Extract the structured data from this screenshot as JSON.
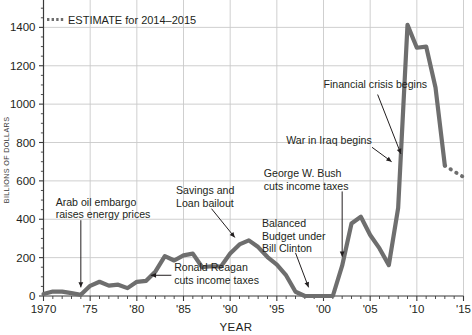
{
  "chart_data": {
    "type": "line",
    "title": "",
    "xlabel": "YEAR",
    "ylabel": "BILLIONS OF DOLLARS",
    "xlim": [
      1970,
      2015
    ],
    "ylim": [
      0,
      1600
    ],
    "grid": true,
    "ytick_step": 200,
    "xtick_step": 5,
    "yticks": [
      0,
      200,
      400,
      600,
      800,
      1000,
      1200,
      1400,
      1600
    ],
    "ytick_labels": [
      "0",
      "200",
      "400",
      "600",
      "800",
      "1000",
      "1200",
      "1400",
      "1600"
    ],
    "xticks": [
      1970,
      1975,
      1980,
      1985,
      1990,
      1995,
      2000,
      2005,
      2010,
      2015
    ],
    "xtick_labels": [
      "1970",
      "'75",
      "'80",
      "'85",
      "'90",
      "'95",
      "'00",
      "'05",
      "'10",
      "'15"
    ],
    "minor_xticks_per_interval": 5,
    "minor_yticks_per_interval": 4,
    "line_color": "#6e6e6e",
    "line_width": 4.2,
    "series": [
      {
        "name": "Federal deficit",
        "style": "solid",
        "x": [
          1970,
          1971,
          1972,
          1973,
          1974,
          1975,
          1976,
          1977,
          1978,
          1979,
          1980,
          1981,
          1982,
          1983,
          1984,
          1985,
          1986,
          1987,
          1988,
          1989,
          1990,
          1991,
          1992,
          1993,
          1994,
          1995,
          1996,
          1997,
          1998,
          1999,
          2000,
          2001,
          2002,
          2003,
          2004,
          2005,
          2006,
          2007,
          2008,
          2009,
          2010,
          2011,
          2012,
          2013
        ],
        "values": [
          10,
          23,
          23,
          15,
          6,
          53,
          74,
          54,
          59,
          41,
          74,
          79,
          128,
          208,
          185,
          212,
          221,
          150,
          155,
          153,
          221,
          269,
          290,
          255,
          203,
          164,
          107,
          22,
          0,
          0,
          0,
          0,
          158,
          378,
          413,
          318,
          248,
          161,
          459,
          1413,
          1294,
          1300,
          1087,
          680
        ]
      },
      {
        "name": "ESTIMATE for 2014–2015",
        "style": "dotted",
        "x": [
          2013,
          2014,
          2015
        ],
        "values": [
          680,
          649,
          620
        ]
      }
    ],
    "legend": {
      "position": "top-left-inside",
      "entries": [
        {
          "label": "ESTIMATE for 2014–2015",
          "marker": "dotted-line",
          "color": "#6e6e6e"
        }
      ]
    },
    "annotations": [
      {
        "name": "arab-oil-embargo",
        "lines": [
          "Arab oil embargo",
          "raises energy prices"
        ],
        "text_x": 1971.3,
        "text_y": 470,
        "arrow_from_x": 1974.0,
        "arrow_from_y": 395,
        "arrow_to_x": 1974.0,
        "arrow_to_y": 45
      },
      {
        "name": "savings-and-loan-bailout",
        "lines": [
          "Savings and",
          "Loan bailout"
        ],
        "text_x": 1984.2,
        "text_y": 530,
        "arrow_from_x": 1988.0,
        "arrow_from_y": 455,
        "arrow_to_x": 1990.5,
        "arrow_to_y": 305
      },
      {
        "name": "ronald-reagan-cuts-income-taxes",
        "lines": [
          "Ronald Reagan",
          "cuts income taxes"
        ],
        "text_x": 1984.0,
        "text_y": 128,
        "arrow_from_x": 1983.7,
        "arrow_from_y": 108,
        "arrow_to_x": 1981.5,
        "arrow_to_y": 108
      },
      {
        "name": "balanced-budget-under-bill-clinton",
        "lines": [
          "Balanced",
          "Budget under",
          "Bill Clinton"
        ],
        "text_x": 1993.4,
        "text_y": 360,
        "arrow_from_x": 1997.0,
        "arrow_from_y": 225,
        "arrow_to_x": 1998.4,
        "arrow_to_y": 45
      },
      {
        "name": "george-w-bush-cuts-income-taxes",
        "lines": [
          "George W. Bush",
          "cuts income taxes"
        ],
        "text_x": 1993.6,
        "text_y": 620,
        "arrow_from_x": 2002.0,
        "arrow_from_y": 545,
        "arrow_to_x": 2002.0,
        "arrow_to_y": 205
      },
      {
        "name": "war-in-iraq-begins",
        "lines": [
          "War in Iraq begins"
        ],
        "text_x": 1996.0,
        "text_y": 790,
        "arrow_from_x": 2005.2,
        "arrow_from_y": 775,
        "arrow_to_x": 2007.3,
        "arrow_to_y": 700
      },
      {
        "name": "financial-crisis-begins",
        "lines": [
          "Financial crisis begins"
        ],
        "text_x": 2000.0,
        "text_y": 1085,
        "arrow_from_x": 2005.8,
        "arrow_from_y": 1050,
        "arrow_to_x": 2008.3,
        "arrow_to_y": 740
      }
    ]
  },
  "axes": {
    "ylabel": "BILLIONS OF DOLLARS",
    "xlabel": "YEAR"
  },
  "legend": {
    "estimate_label": "ESTIMATE for 2014–2015"
  },
  "colors": {
    "line": "#6e6e6e",
    "grid": "#c9c9c9",
    "axis": "#3a3a3a",
    "text": "#231f20",
    "background": "#ffffff"
  }
}
